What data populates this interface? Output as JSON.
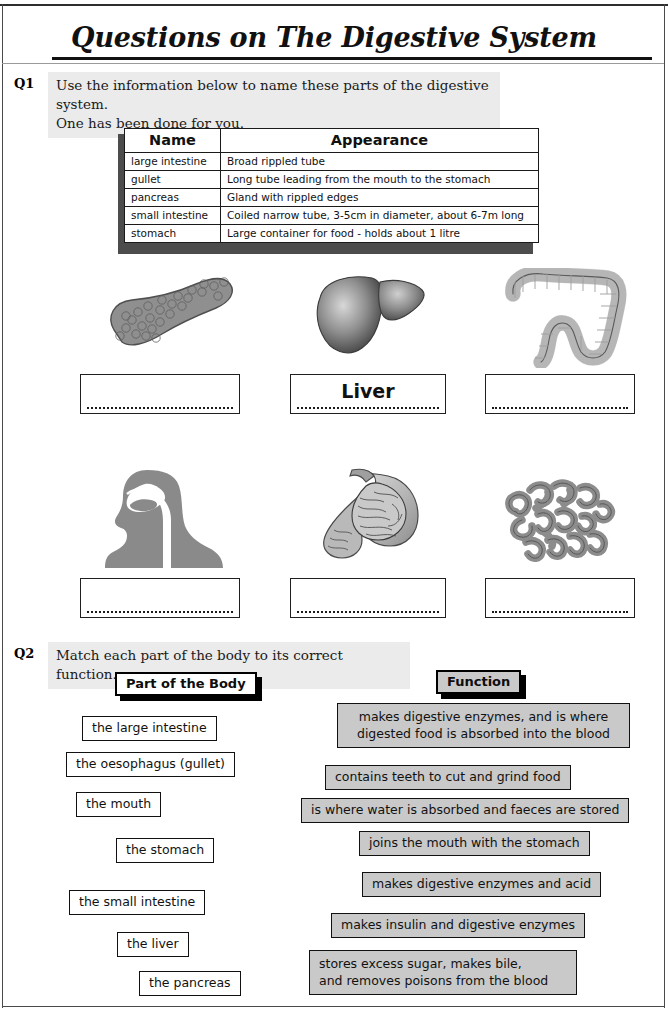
{
  "document": {
    "title": "Questions on The Digestive System"
  },
  "q1": {
    "number": "Q1",
    "instruction_line1": "Use the information below to name these parts of the digestive system.",
    "instruction_line2": "One has been done for you.",
    "table": {
      "headers": [
        "Name",
        "Appearance"
      ],
      "rows": [
        [
          "large intestine",
          "Broad rippled tube"
        ],
        [
          "gullet",
          "Long tube leading from the mouth to the stomach"
        ],
        [
          "pancreas",
          "Gland with rippled edges"
        ],
        [
          "small intestine",
          "Coiled narrow tube, 3-5cm in diameter, about 6-7m long"
        ],
        [
          "stomach",
          "Large container for food - holds about 1 litre"
        ]
      ]
    },
    "figures": [
      {
        "organ": "pancreas",
        "answer": ""
      },
      {
        "organ": "liver",
        "answer": "Liver"
      },
      {
        "organ": "large-intestine",
        "answer": ""
      },
      {
        "organ": "mouth-and-gullet",
        "answer": ""
      },
      {
        "organ": "stomach",
        "answer": ""
      },
      {
        "organ": "small-intestine",
        "answer": ""
      }
    ]
  },
  "q2": {
    "number": "Q2",
    "instruction": "Match each part of the body to its correct function.",
    "column_headers": {
      "parts": "Part of the Body",
      "functions": "Function"
    },
    "parts": [
      "the large intestine",
      "the oesophagus (gullet)",
      "the mouth",
      "the stomach",
      "the small intestine",
      "the liver",
      "the pancreas"
    ],
    "functions": [
      {
        "line1": "makes digestive enzymes, and is where",
        "line2": "digested food is absorbed into the blood"
      },
      {
        "line1": "contains teeth to cut and grind food",
        "line2": ""
      },
      {
        "line1": "is where water is absorbed and faeces are stored",
        "line2": ""
      },
      {
        "line1": "joins the mouth with the stomach",
        "line2": ""
      },
      {
        "line1": "makes digestive enzymes and acid",
        "line2": ""
      },
      {
        "line1": "makes insulin and digestive enzymes",
        "line2": ""
      },
      {
        "line1": "stores excess sugar, makes bile,",
        "line2": "and removes poisons from the blood"
      }
    ]
  },
  "colors": {
    "question_band": "#ebebeb",
    "function_box": "#c9c9c9",
    "ink": "#111111",
    "organ_mid_gray": "#8c8c8c",
    "organ_light_gray": "#c4c4c4"
  }
}
